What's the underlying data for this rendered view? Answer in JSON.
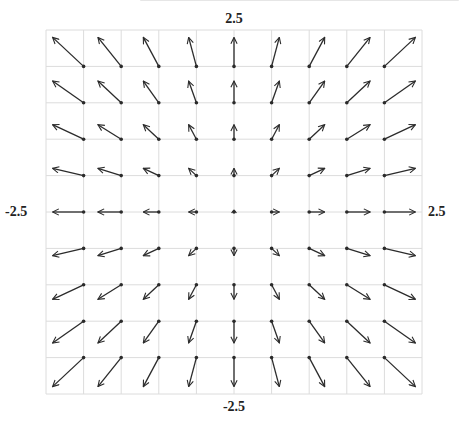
{
  "diagram": {
    "field": {
      "fx": "x",
      "fy": "y",
      "type": "radial-outward"
    },
    "labels": {
      "top": "2.5",
      "bottom": "-2.5",
      "left": "-2.5",
      "right": "2.5"
    },
    "domain": {
      "xmin": -2.5,
      "xmax": 2.5,
      "ymin": -2.5,
      "ymax": 2.5
    },
    "sample_points": {
      "x": [
        -2,
        -1.5,
        -1,
        -0.5,
        0,
        0.5,
        1,
        1.5,
        2
      ],
      "y": [
        2,
        1.5,
        1,
        0.5,
        0,
        -0.5,
        -1,
        -1.5,
        -2
      ]
    },
    "grid": {
      "left": 46,
      "top": 30,
      "right": 422,
      "bottom": 394,
      "cols": 10,
      "rows": 10,
      "line_color": "#dcdcdc"
    },
    "arrow": {
      "color": "#2b2b2b",
      "scale_x": 15.5,
      "scale_y": 14.5,
      "dot_radius": 1.8
    },
    "clipped_header_text": ""
  }
}
